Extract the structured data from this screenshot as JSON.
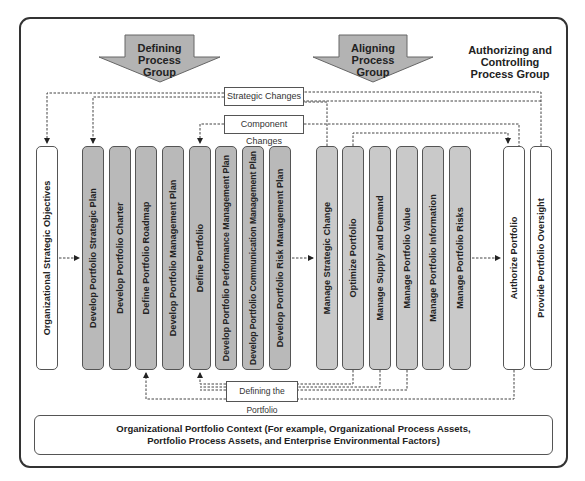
{
  "groups": {
    "defining": {
      "line1": "Defining",
      "line2": "Process Group"
    },
    "aligning": {
      "line1": "Aligning",
      "line2": "Process Group"
    },
    "authorizing": {
      "line1": "Authorizing and Controlling",
      "line2": "Process Group"
    }
  },
  "inputs": {
    "org_objectives": "Organizational Strategic Objectives"
  },
  "defining_processes": [
    "Develop Portfolio Strategic Plan",
    "Develop Portfolio Charter",
    "Define Portfolio Roadmap",
    "Develop Portfolio Management Plan",
    "Define Portfolio",
    "Develop Portfolio Performance Management Plan",
    "Develop Portfolio Communication Management Plan",
    "Develop Portfolio Risk Management Plan"
  ],
  "aligning_processes": [
    "Manage Strategic Change",
    "Optimize Portfolio",
    "Manage Supply and Demand",
    "Manage Portfolio Value",
    "Manage Portfolio Information",
    "Manage Portfolio Risks"
  ],
  "authorizing_processes": [
    "Authorize Portfolio",
    "Provide Portfolio Oversight"
  ],
  "feedback_labels": {
    "strategic_changes": "Strategic Changes",
    "component_changes": "Component Changes",
    "defining_portfolio": "Defining the Portfolio"
  },
  "context": {
    "line1": "Organizational Portfolio Context (For example, Organizational Process Assets,",
    "line2": "Portfolio Process Assets, and Enterprise Environmental Factors)"
  },
  "colors": {
    "arrow_fill": "#b3b3b3",
    "defining_fill": "#b9b9b9",
    "aligning_fill": "#c9c9c9",
    "border": "#555555"
  }
}
